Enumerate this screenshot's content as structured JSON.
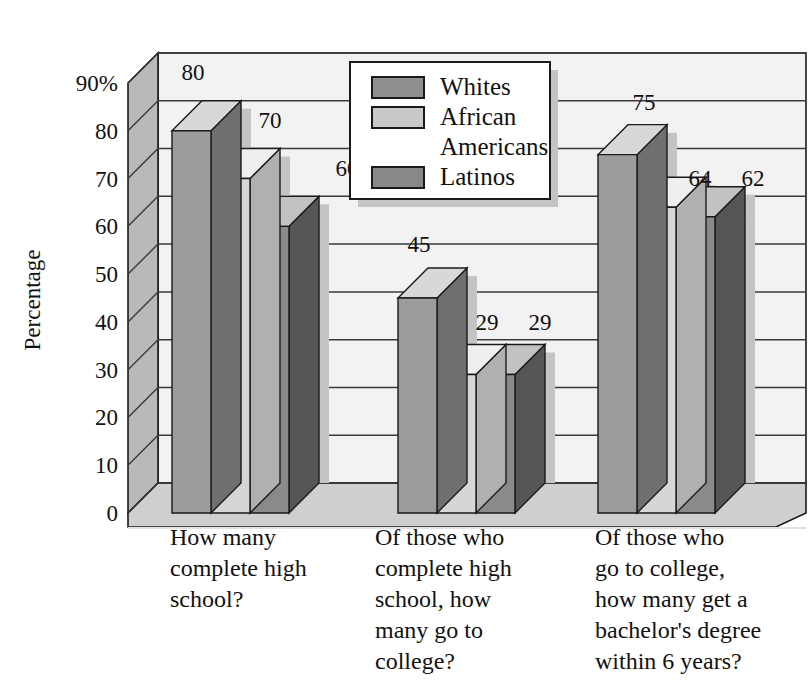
{
  "chart_data": {
    "type": "bar",
    "title": "",
    "subtitle": "",
    "xlabel": "",
    "ylabel": "Percentage",
    "ylim": [
      0,
      90
    ],
    "yticks": [
      0,
      10,
      20,
      30,
      40,
      50,
      60,
      70,
      80,
      90
    ],
    "ytick_labels": [
      "0",
      "10",
      "20",
      "30",
      "40",
      "50",
      "60",
      "70",
      "80",
      "90%"
    ],
    "grid": true,
    "legend_position": "top-center",
    "three_d": true,
    "categories": [
      "How many complete high school?",
      "Of those who complete high school, how many go to college?",
      "Of those who go to college, how many get a bachelor's degree within 6 years?"
    ],
    "category_lines": [
      [
        "How many",
        "complete high",
        "school?"
      ],
      [
        "Of those who",
        "complete high",
        "school, how",
        "many go to",
        "college?"
      ],
      [
        "Of those who",
        "go to college,",
        "how many get a",
        "bachelor's degree",
        "within 6 years?"
      ]
    ],
    "series": [
      {
        "name": "Whites",
        "values": [
          80,
          45,
          75
        ],
        "color": "#9c9c9c",
        "top_color": "#d8d8d8",
        "side_color": "#6f6f6f"
      },
      {
        "name": "African Americans",
        "values": [
          70,
          29,
          64
        ],
        "color": "#d6d6d6",
        "top_color": "#efefef",
        "side_color": "#b0b0b0"
      },
      {
        "name": "Latinos",
        "values": [
          60,
          29,
          62
        ],
        "color": "#8a8a8a",
        "top_color": "#c2c2c2",
        "side_color": "#565656"
      }
    ],
    "data_labels": [
      [
        80,
        70,
        60
      ],
      [
        45,
        29,
        29
      ],
      [
        75,
        64,
        62
      ]
    ]
  },
  "legend": {
    "entries": [
      {
        "label": "Whites",
        "swatch": "#8f8f8f"
      },
      {
        "label": "African",
        "swatch": "#c9c9c9"
      },
      {
        "label": "Americans",
        "swatch": null
      },
      {
        "label": "Latinos",
        "swatch": "#888888"
      }
    ]
  },
  "axes": {
    "y_title": "Percentage",
    "y_ticks": [
      "90%",
      "80",
      "70",
      "60",
      "50",
      "40",
      "30",
      "20",
      "10",
      "0"
    ]
  },
  "colors": {
    "background": "#ffffff",
    "wall": "#f2f2f2",
    "wall_side": "#b9b9b9",
    "floor": "#cfcfcf",
    "floor_front": "#e2e2e2",
    "gridline": "#3a3a3a",
    "shadow": "#c4c4c4",
    "outline": "#1a1a1a"
  }
}
